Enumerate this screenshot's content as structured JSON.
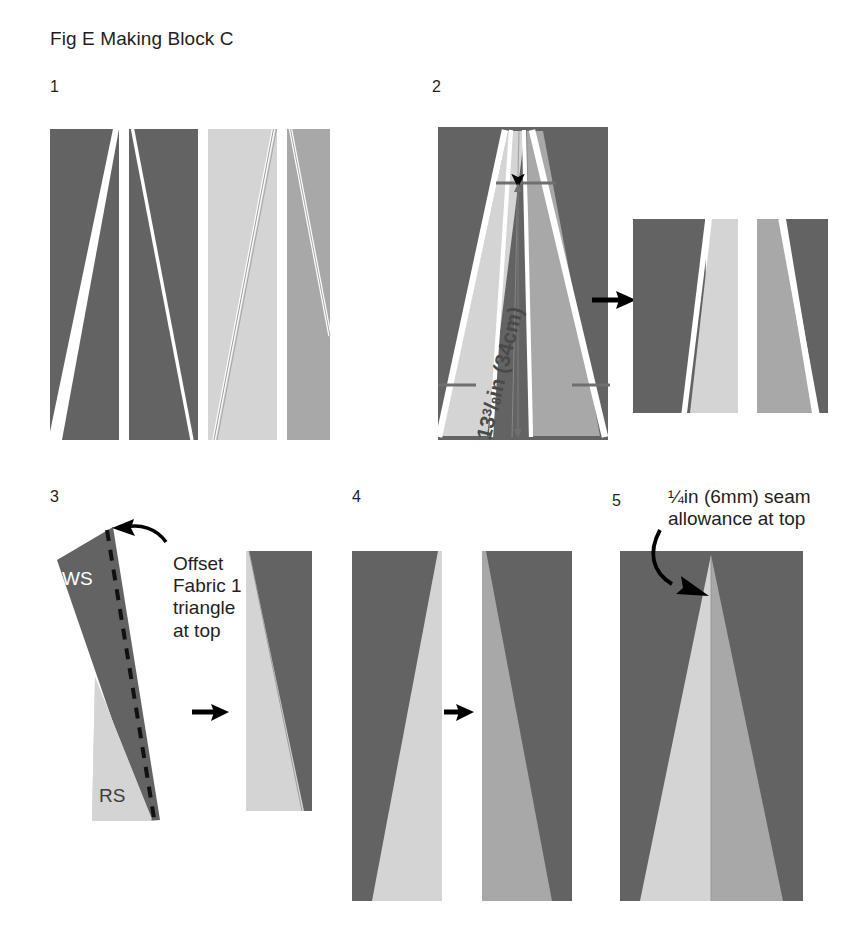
{
  "figure": {
    "title": "Fig E Making Block C",
    "background": "#ffffff"
  },
  "palette": {
    "dark_gray": "#636363",
    "medium_gray": "#a8a8a8",
    "light_gray": "#d4d4d4",
    "white": "#ffffff",
    "black": "#000000",
    "dim_line": "#6f6f6f",
    "text": "#231f20"
  },
  "steps": [
    {
      "number": "1",
      "description": "Four cut fabric strips with angled seam lines: two dark, one light, one medium"
    },
    {
      "number": "2",
      "description": "Joined strips forming tapered wedges, with length measurement, arrow to two sewn units",
      "dimension_label_prefix": "13",
      "dimension_label_fraction_num": "3",
      "dimension_label_fraction_den": "8",
      "dimension_label_suffix": "in (34cm)",
      "dimension_label_full": "13 3/8in (34cm)"
    },
    {
      "number": "3",
      "description": "Offset strip pair with stitching line, arrow to joined unit",
      "callout_lines": [
        "Offset",
        "Fabric 1",
        "triangle",
        "at top"
      ],
      "label_ws": "WS",
      "label_rs": "RS"
    },
    {
      "number": "4",
      "description": "Two mirrored sewn units joined by arrow"
    },
    {
      "number": "5",
      "description": "Completed Block C with central light triangle",
      "callout_lines": [
        "¼in (6mm) seam",
        "allowance at top"
      ]
    }
  ]
}
